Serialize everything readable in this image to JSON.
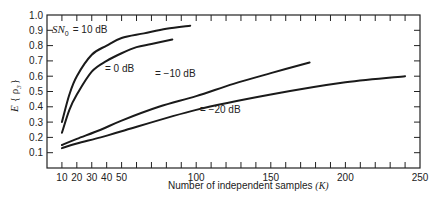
{
  "chart_data": {
    "type": "line",
    "title": "",
    "xlabel": "Number of independent samples (K)",
    "ylabel": "E {ρ3}",
    "xlim": [
      0,
      250
    ],
    "ylim": [
      0,
      1.0
    ],
    "grid": false,
    "legend_position": "inline labels",
    "x_tick_labels": [
      "10",
      "20",
      "30",
      "40",
      "50",
      "100",
      "150",
      "200",
      "250"
    ],
    "x_tick_values": [
      10,
      20,
      30,
      40,
      50,
      100,
      150,
      200,
      250
    ],
    "x_minor_tick_step": 10,
    "y_tick_labels": [
      "0.1",
      "0.2",
      "0.3",
      "0.4",
      "0.5",
      "0.6",
      "0.7",
      "0.8",
      "0.9",
      "1.0"
    ],
    "y_tick_values": [
      0.1,
      0.2,
      0.3,
      0.4,
      0.5,
      0.6,
      0.7,
      0.8,
      0.9,
      1.0
    ],
    "series": [
      {
        "name": "SN0 = 10 dB",
        "label": "= 10 dB",
        "x": [
          10,
          15,
          20,
          30,
          40,
          50,
          65,
          80,
          96
        ],
        "y": [
          0.3,
          0.48,
          0.6,
          0.74,
          0.8,
          0.85,
          0.88,
          0.91,
          0.93
        ]
      },
      {
        "name": "0 dB",
        "label": "= 0 dB",
        "x": [
          10,
          15,
          20,
          30,
          40,
          50,
          60,
          70,
          84
        ],
        "y": [
          0.23,
          0.38,
          0.48,
          0.63,
          0.7,
          0.75,
          0.79,
          0.81,
          0.84
        ]
      },
      {
        "name": "-10 dB",
        "label": "= −10 dB",
        "x": [
          10,
          20,
          36,
          50,
          75,
          100,
          125,
          150,
          176
        ],
        "y": [
          0.15,
          0.19,
          0.25,
          0.31,
          0.4,
          0.47,
          0.55,
          0.62,
          0.69
        ]
      },
      {
        "name": "-20 dB",
        "label": "= −20 dB",
        "x": [
          10,
          20,
          36,
          50,
          100,
          150,
          200,
          240
        ],
        "y": [
          0.13,
          0.16,
          0.2,
          0.24,
          0.38,
          0.48,
          0.56,
          0.6
        ]
      }
    ]
  },
  "labels": {
    "sn_prefix": "SN",
    "sn_sub": "0",
    "curve_10": "= 10 dB",
    "curve_0": "= 0 dB",
    "curve_m10": "= −10 dB",
    "curve_m20": "= −20 dB",
    "xlabel_text": "Number of independent samples ",
    "xlabel_var": "(K)",
    "ylabel_e": "E",
    "ylabel_rho": "{ ρ",
    "ylabel_sub": "3",
    "ylabel_close": "}"
  }
}
